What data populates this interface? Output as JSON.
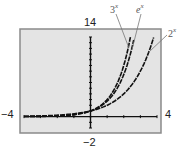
{
  "chart_data": {
    "type": "line",
    "title": "",
    "xlabel": "",
    "ylabel": "",
    "xlim": [
      -4,
      4
    ],
    "ylim": [
      -2,
      14
    ],
    "grid": false,
    "legend_position": "inline annotations",
    "x_tick_labels": [
      "-4",
      "4"
    ],
    "y_tick_labels": [
      "-2",
      "14"
    ],
    "x_ticks": [
      -4,
      -3,
      -2,
      -1,
      0,
      1,
      2,
      3,
      4
    ],
    "y_ticks": [
      -2,
      -1,
      0,
      1,
      2,
      3,
      4,
      5,
      6,
      7,
      8,
      9,
      10,
      11,
      12,
      13,
      14
    ],
    "series": [
      {
        "name": "3^x",
        "formula": "y = 3^x",
        "x": [
          -4,
          -3,
          -2,
          -1,
          0,
          0.5,
          1,
          1.5,
          2,
          2.4
        ],
        "values": [
          0.012,
          0.037,
          0.111,
          0.333,
          1,
          1.732,
          3,
          5.196,
          9,
          13.97
        ]
      },
      {
        "name": "e^x",
        "formula": "y = e^x",
        "x": [
          -4,
          -3,
          -2,
          -1,
          0,
          0.5,
          1,
          1.5,
          2,
          2.6
        ],
        "values": [
          0.018,
          0.05,
          0.135,
          0.368,
          1,
          1.649,
          2.718,
          4.482,
          7.389,
          13.46
        ]
      },
      {
        "name": "2^x",
        "formula": "y = 2^x",
        "x": [
          -4,
          -3,
          -2,
          -1,
          0,
          1,
          2,
          3,
          3.8
        ],
        "values": [
          0.0625,
          0.125,
          0.25,
          0.5,
          1,
          2,
          4,
          8,
          13.93
        ]
      }
    ]
  },
  "labels": {
    "ymax": "14",
    "ymin": "−2",
    "xmin": "−4",
    "xmax": "4",
    "series_3": {
      "base": "3",
      "exp": "x"
    },
    "series_e": {
      "base": "e",
      "exp": "x"
    },
    "series_2": {
      "base": "2",
      "exp": "x"
    }
  },
  "colors": {
    "plot_background": "#e4e4e4",
    "frame": "#8a8a8a",
    "axis": "#111111",
    "curve": "#111111",
    "leader": "#777777"
  }
}
